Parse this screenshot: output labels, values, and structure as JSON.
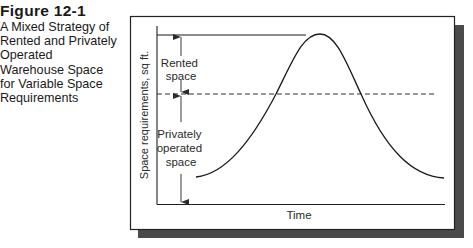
{
  "caption": {
    "figure_number": "Figure 12-1",
    "title_lines": [
      "A Mixed Strategy of",
      "Rented and Privately",
      "Operated",
      "Warehouse Space",
      "for Variable Space",
      "Requirements"
    ]
  },
  "diagram": {
    "y_axis_label": "Space requirements, sq ft.",
    "x_axis_label": "Time",
    "regions": {
      "rented": [
        "Rented",
        "space"
      ],
      "private": [
        "Privately",
        "operated",
        "space"
      ]
    },
    "elements": {
      "curve": "bell-shaped demand curve for space requirements over time",
      "dashed_line": "privately operated capacity level",
      "top_line": "peak requirement level"
    },
    "colors": {
      "line": "#1a1a1a",
      "arrow": "#3a3a3a",
      "shadow": "#4a4a4a",
      "frame": "#222222"
    }
  }
}
